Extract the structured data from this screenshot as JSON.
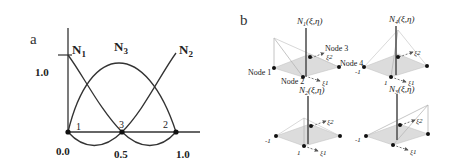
{
  "panel_a": {
    "label": "a",
    "y_tick": "1.0",
    "x_ticks": [
      "0.0",
      "0.5",
      "1.0"
    ],
    "curve_labels": {
      "N1": {
        "base": "N",
        "sub": "1"
      },
      "N3": {
        "base": "N",
        "sub": "3"
      },
      "N2": {
        "base": "N",
        "sub": "2"
      }
    },
    "node_labels": [
      "1",
      "3",
      "2"
    ],
    "colors": {
      "curve": "#333333",
      "axis": "#333333",
      "node": "#111111"
    }
  },
  "panel_b": {
    "label": "b",
    "subplots": [
      {
        "title": "N1(ξ,η)",
        "title_base": "N",
        "title_sub": "1",
        "title_args": "(ξ,η)"
      },
      {
        "title": "N4(ξ,η)",
        "title_base": "N",
        "title_sub": "4",
        "title_args": "(ξ,η)"
      },
      {
        "title": "N2(ξ,η)",
        "title_base": "N",
        "title_sub": "2",
        "title_args": "(ξ,η)"
      },
      {
        "title": "N3(ξ,η)",
        "title_base": "N",
        "title_sub": "3",
        "title_args": "(ξ,η)"
      }
    ],
    "node_labels": {
      "node1": "Node 1",
      "node2": "Node 2",
      "node3": "Node 3",
      "node4": "Node 4"
    },
    "axis_labels": {
      "xi1": "ξ1",
      "xi2": "ξ2"
    },
    "tick_labels": {
      "minus_one": "-1",
      "one": "1"
    },
    "colors": {
      "plane": "#d9d9d9",
      "plane_edge": "#bfbfbf",
      "axis": "#555555",
      "node": "#111111",
      "surface_line": "#aaaaaa"
    }
  }
}
